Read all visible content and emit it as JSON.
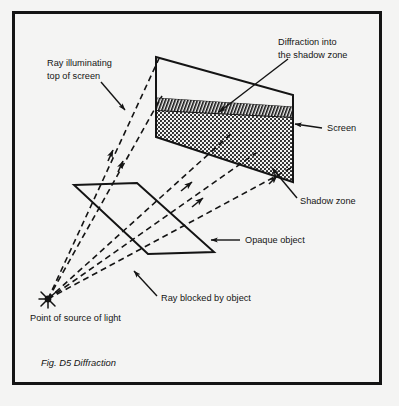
{
  "figure": {
    "caption": "Fig. D5 Diffraction",
    "background_color": "#f4f4f3",
    "ink_color": "#141414",
    "border": {
      "x": 12,
      "y": 11,
      "width": 370,
      "height": 374,
      "stroke_width": 3
    }
  },
  "labels": {
    "ray_illuminating": {
      "line1": "Ray illuminating",
      "line2": "top of screen",
      "x": 47,
      "y": 66
    },
    "diffraction": {
      "line1": "Diffraction into",
      "line2": "the shadow zone",
      "x": 278,
      "y": 45
    },
    "screen": {
      "text": "Screen",
      "x": 327,
      "y": 131
    },
    "shadow_zone": {
      "text": "Shadow zone",
      "x": 300,
      "y": 204
    },
    "opaque_object": {
      "text": "Opaque object",
      "x": 243,
      "y": 243
    },
    "ray_blocked": {
      "text": "Ray blocked by object",
      "x": 160,
      "y": 301
    },
    "point_source": {
      "text": "Point of source of light",
      "x": 30,
      "y": 320
    }
  },
  "diagram": {
    "screen": {
      "name": "screen-panel",
      "corners_outline": "156,57 293,95 293,182 156,137",
      "white_top_region": "156,57 293,95 293,107 156,98",
      "hatched_band": "156,98 293,107 293,117 156,110",
      "stippled_shadow_region": "156,110 293,117 293,182 156,137"
    },
    "opaque_object": {
      "name": "opaque-object-panel",
      "corners": "74,185 137,183 214,252 148,254"
    },
    "light_source": {
      "name": "point-light-source",
      "x": 48,
      "y": 299,
      "style": "starburst"
    },
    "rays": [
      {
        "name": "ray-top-of-screen",
        "from": "48,299",
        "to": "160,58",
        "arrowheads": 1,
        "dashed": true
      },
      {
        "name": "ray-upper-illuminating",
        "from": "48,299",
        "to": "163,96",
        "arrowheads": 1,
        "dashed": true
      },
      {
        "name": "ray-through-to-screen-mid",
        "from": "48,299",
        "to": "230,133",
        "arrowheads": 1,
        "dashed": true
      },
      {
        "name": "ray-blocked-lower",
        "from": "48,299",
        "to": "253,152",
        "arrowheads": 1,
        "dashed": true
      },
      {
        "name": "ray-blocked-by-object",
        "from": "48,299",
        "to": "290,168",
        "arrowheads": 0,
        "dashed": true
      }
    ],
    "leaders": [
      {
        "name": "leader-ray-illuminating",
        "from": "101,82",
        "to": "124,108"
      },
      {
        "name": "leader-diffraction",
        "from": "286,60",
        "to": "218,113"
      },
      {
        "name": "leader-screen",
        "from": "320,128",
        "to": "296,124"
      },
      {
        "name": "leader-shadow-zone",
        "from": "296,199",
        "to": "270,170"
      },
      {
        "name": "leader-opaque-object",
        "from": "239,240",
        "to": "212,240"
      },
      {
        "name": "leader-ray-blocked",
        "from": "156,297",
        "to": "134,273"
      }
    ]
  }
}
